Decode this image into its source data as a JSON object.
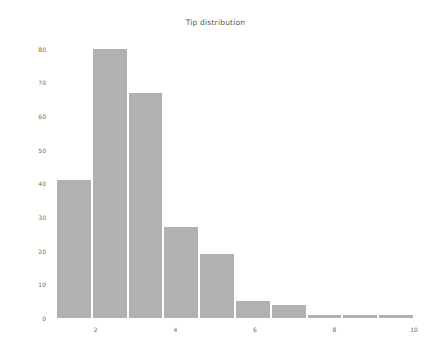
{
  "chart_data": {
    "type": "bar",
    "title": "Tip distribution",
    "xlabel": "",
    "ylabel": "",
    "grid": false,
    "legend": false,
    "legend_position": "none",
    "bar_color": "#b1b1b1",
    "bar_edge_color": "#ffffff",
    "background_color": "#ffffff",
    "tick_label_color": "#6b6b6b",
    "title_color": "#555555",
    "xlim": [
      1.0,
      10.0
    ],
    "ylim": [
      0,
      82
    ],
    "xticks": [
      2,
      4,
      6,
      8,
      10
    ],
    "xtick_labels": [
      "2",
      "4",
      "6",
      "8",
      "10"
    ],
    "yticks": [
      0,
      10,
      20,
      30,
      40,
      50,
      60,
      70,
      80
    ],
    "ytick_labels": [
      "0",
      "10",
      "20",
      "30",
      "40",
      "50",
      "60",
      "70",
      "80"
    ],
    "bin_edges": [
      1.0,
      1.9,
      2.8,
      3.7,
      4.6,
      5.5,
      6.4,
      7.3,
      8.2,
      9.1,
      10.0
    ],
    "bin_centers": [
      1.45,
      2.35,
      3.25,
      4.15,
      5.05,
      5.95,
      6.85,
      7.75,
      8.65,
      9.55
    ],
    "categories": [
      "1.0-1.9",
      "1.9-2.8",
      "2.8-3.7",
      "3.7-4.6",
      "4.6-5.5",
      "5.5-6.4",
      "6.4-7.3",
      "7.3-8.2",
      "8.2-9.1",
      "9.1-10.0"
    ],
    "values": [
      41,
      80,
      67,
      27,
      19,
      5,
      4,
      1,
      1,
      1
    ]
  }
}
